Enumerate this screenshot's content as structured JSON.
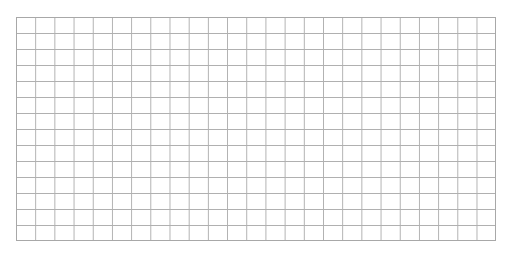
{
  "grid": {
    "columns": 25,
    "rows": 14,
    "line_color": "#b0b0b0",
    "background": "#ffffff",
    "cells_content": "empty"
  }
}
